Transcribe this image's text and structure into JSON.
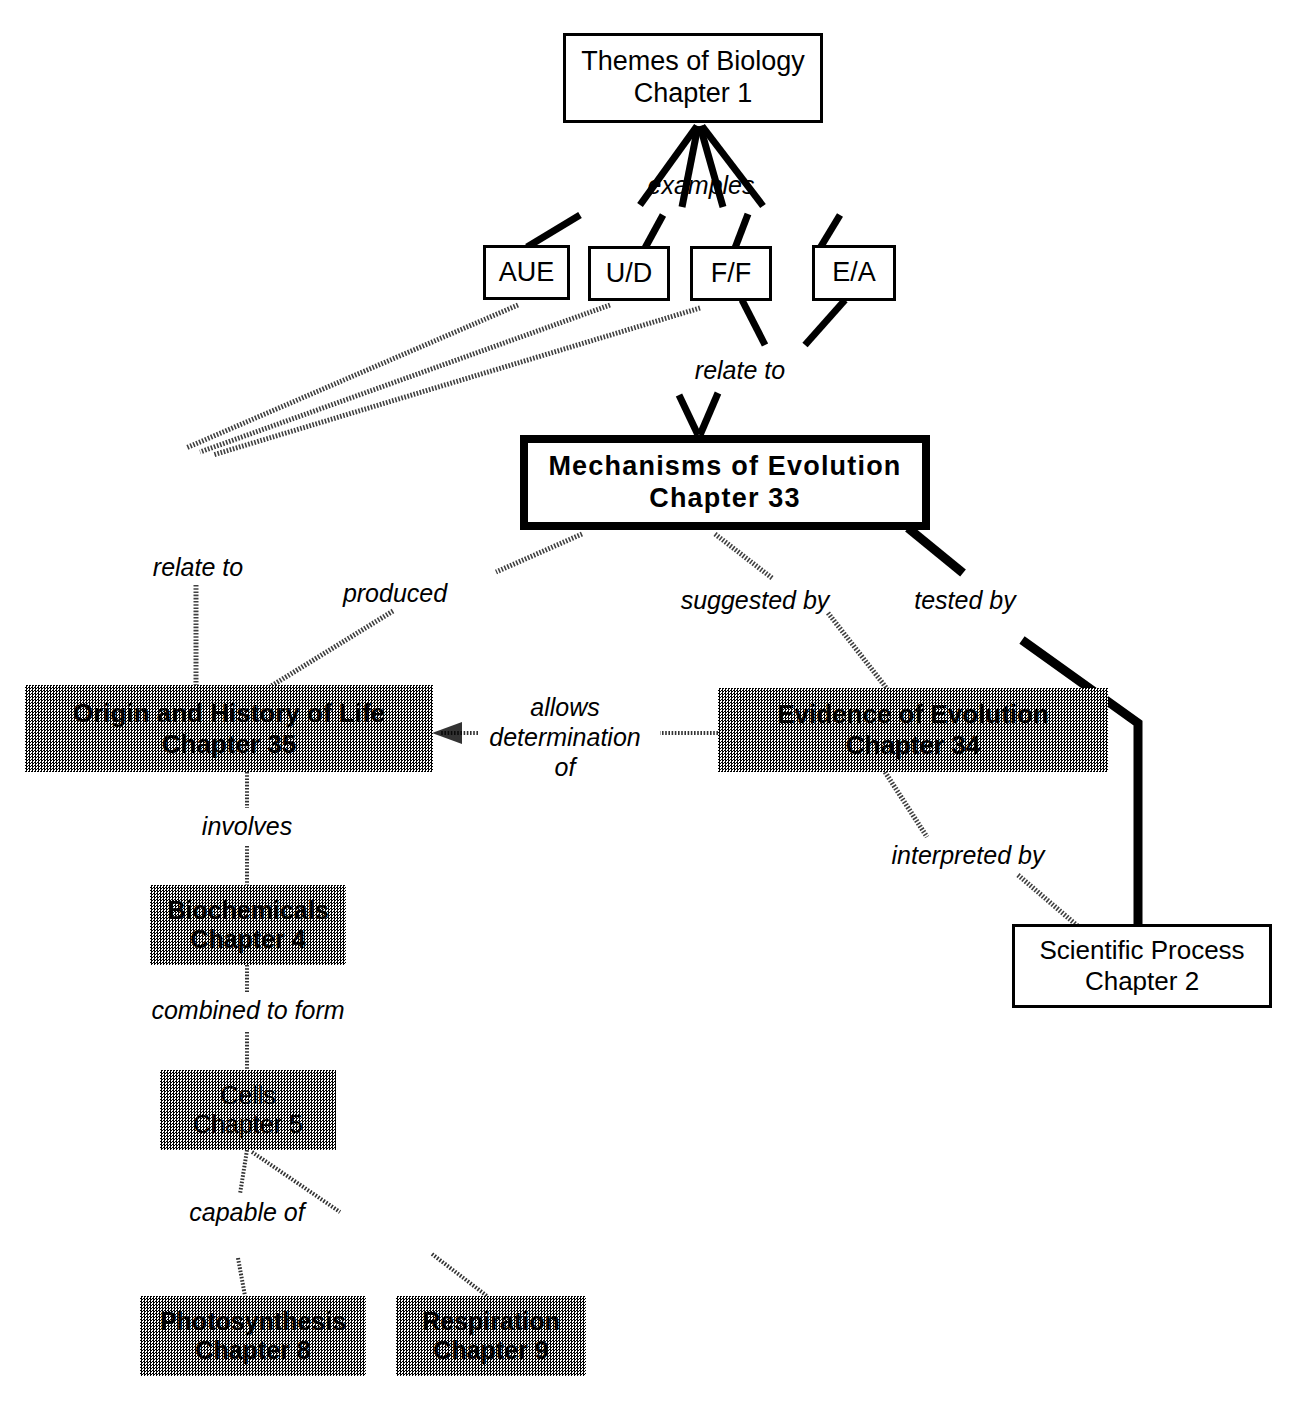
{
  "diagram": {
    "colors": {
      "ink": "#000000",
      "paper": "#ffffff",
      "shade": "#808080"
    },
    "nodes": [
      {
        "id": "themes",
        "line1": "Themes of Biology",
        "line2": "Chapter 1",
        "style": "plain"
      },
      {
        "id": "aue",
        "line1": "AUE",
        "line2": "",
        "style": "plain"
      },
      {
        "id": "ud",
        "line1": "U/D",
        "line2": "",
        "style": "plain"
      },
      {
        "id": "ff",
        "line1": "F/F",
        "line2": "",
        "style": "plain"
      },
      {
        "id": "ea",
        "line1": "E/A",
        "line2": "",
        "style": "plain"
      },
      {
        "id": "mechanisms",
        "line1": "Mechanisms  of  Evolution",
        "line2": "Chapter  33",
        "style": "heavy"
      },
      {
        "id": "origin",
        "line1": "Origin and History of Life",
        "line2": "Chapter 35",
        "style": "shaded"
      },
      {
        "id": "evidence",
        "line1": "Evidence of Evolution",
        "line2": "Chapter 34",
        "style": "shaded"
      },
      {
        "id": "scientific",
        "line1": "Scientific Process",
        "line2": "Chapter 2",
        "style": "plain"
      },
      {
        "id": "biochemicals",
        "line1": "Biochemicals",
        "line2": "Chapter 4",
        "style": "shaded"
      },
      {
        "id": "cells",
        "line1": "Cells",
        "line2": "Chapter 5",
        "style": "shaded"
      },
      {
        "id": "photosynthesis",
        "line1": "Photosynthesis",
        "line2": "Chapter 8",
        "style": "shaded"
      },
      {
        "id": "respiration",
        "line1": "Respiration",
        "line2": "Chapter 9",
        "style": "shaded"
      }
    ],
    "links": [
      {
        "id": "examples",
        "label": "examples",
        "from": "themes",
        "to": "aue,ud,ff,ea"
      },
      {
        "id": "relate-to-mech",
        "label": "relate to",
        "from": "ff,ea",
        "to": "mechanisms"
      },
      {
        "id": "relate-to-origin",
        "label": "relate to",
        "from": "aue,ud,ff",
        "to": "origin"
      },
      {
        "id": "produced",
        "label": "produced",
        "from": "mechanisms",
        "to": "origin"
      },
      {
        "id": "suggested-by",
        "label": "suggested by",
        "from": "mechanisms",
        "to": "evidence"
      },
      {
        "id": "tested-by",
        "label": "tested by",
        "from": "mechanisms",
        "to": "scientific"
      },
      {
        "id": "allows-determination",
        "label": "allows\ndetermination\nof",
        "from": "evidence",
        "to": "origin"
      },
      {
        "id": "interpreted-by",
        "label": "interpreted by",
        "from": "evidence",
        "to": "scientific"
      },
      {
        "id": "involves",
        "label": "involves",
        "from": "origin",
        "to": "biochemicals"
      },
      {
        "id": "combined-to-form",
        "label": "combined to form",
        "from": "biochemicals",
        "to": "cells"
      },
      {
        "id": "capable-of",
        "label": "capable of",
        "from": "cells",
        "to": "photosynthesis,respiration"
      }
    ]
  }
}
